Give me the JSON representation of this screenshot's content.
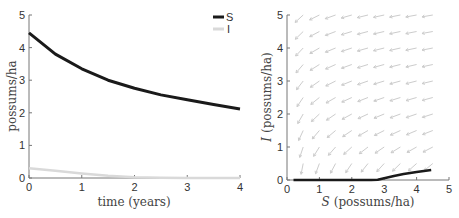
{
  "chart_data": [
    {
      "type": "line",
      "title": "",
      "xlabel": "time (years)",
      "ylabel": "possums/ha",
      "xlim": [
        0,
        4
      ],
      "ylim": [
        0,
        5
      ],
      "xticks": [
        "0",
        "1",
        "2",
        "3",
        "4"
      ],
      "yticks": [
        "0",
        "1",
        "2",
        "3",
        "4",
        "5"
      ],
      "grid": false,
      "legend": {
        "placement": "top-right",
        "entries": [
          "S",
          "I"
        ]
      },
      "series": [
        {
          "name": "S",
          "color": "#1a1a1a",
          "x": [
            0,
            0.5,
            1,
            1.5,
            2,
            2.5,
            3,
            3.5,
            4
          ],
          "y": [
            4.45,
            3.8,
            3.35,
            3.0,
            2.75,
            2.55,
            2.4,
            2.25,
            2.12
          ]
        },
        {
          "name": "I",
          "color": "#d9d9d9",
          "x": [
            0,
            0.5,
            1,
            1.5,
            2,
            2.5,
            3,
            3.5,
            4
          ],
          "y": [
            0.3,
            0.22,
            0.14,
            0.07,
            0.02,
            0.01,
            0.0,
            0.0,
            0.0
          ]
        }
      ]
    },
    {
      "type": "scatter",
      "subtype": "phase-portrait",
      "title": "",
      "xlabel_var": "S",
      "xlabel": "(possums/ha)",
      "ylabel_var": "I",
      "ylabel": "(possums/ha)",
      "xlim": [
        0,
        5
      ],
      "ylim": [
        0,
        5
      ],
      "xticks": [
        "0",
        "1",
        "2",
        "3",
        "4",
        "5"
      ],
      "yticks": [
        "0",
        "1",
        "2",
        "3",
        "4",
        "5"
      ],
      "grid": false,
      "quiver": {
        "color": "#cccccc",
        "s_values": [
          0.5,
          1.0,
          1.5,
          2.0,
          2.5,
          3.0,
          3.5,
          4.0,
          4.5
        ],
        "i_values": [
          0.5,
          1.0,
          1.5,
          2.0,
          2.5,
          3.0,
          3.5,
          4.0,
          4.5,
          5.0
        ],
        "direction": "down-left"
      },
      "trajectory": {
        "color": "#1a1a1a",
        "S": [
          0.2,
          1.0,
          2.0,
          2.6,
          2.8,
          3.0,
          3.3,
          3.6,
          4.0,
          4.45
        ],
        "I": [
          0.0,
          0.0,
          0.0,
          0.0,
          0.01,
          0.05,
          0.12,
          0.18,
          0.24,
          0.3
        ]
      }
    }
  ]
}
